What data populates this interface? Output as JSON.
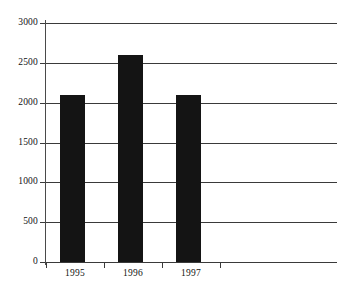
{
  "chart_data": {
    "type": "bar",
    "title": "",
    "subtitle": "",
    "xlabel": "",
    "ylabel": "",
    "categories": [
      "1995",
      "1996",
      "1997"
    ],
    "values": [
      2100,
      2600,
      2100
    ],
    "series": [
      {
        "name": "",
        "values": [
          2100,
          2600,
          2100
        ]
      }
    ],
    "ylim": [
      0,
      3000
    ],
    "yticks": [
      0,
      500,
      1000,
      1500,
      2000,
      2500,
      3000
    ],
    "ytick_labels": [
      "0",
      "500",
      "1000",
      "1500",
      "2000",
      "2500",
      "3000"
    ],
    "grid": true,
    "legend": false,
    "legend_position": "none",
    "annotations": [],
    "bar_color": "#141414",
    "gridline_color": "#3a3a3a",
    "axis_color": "#4a4a4a",
    "background_color": "#ffffff"
  }
}
